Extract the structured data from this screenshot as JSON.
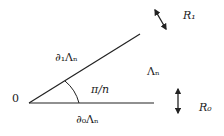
{
  "diagram": {
    "origin_label": "0",
    "angle_label": "π/n",
    "bottom_edge_label": "∂₀Λₙ",
    "top_edge_label": "∂₁Λₙ",
    "region_label": "Λₙ",
    "rotation_top_label": "R₁",
    "rotation_bottom_label": "R₀",
    "stroke_color": "#222222"
  }
}
